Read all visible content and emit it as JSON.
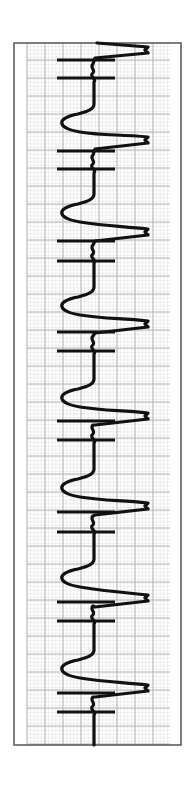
{
  "chart_data": {
    "type": "line",
    "title": "",
    "xlabel": "",
    "ylabel": "",
    "orientation": "vertical (time runs top to bottom)",
    "grid": true,
    "frame": {
      "x": 14,
      "y": 43,
      "width": 167,
      "height": 702,
      "color": "#555555"
    },
    "grid_area": {
      "x": 27,
      "y": 43,
      "width": 143,
      "height": 702
    },
    "grid_major_spacing_px": 18,
    "grid_minor_spacing_px": 3.6,
    "grid_major_color": "#b5b5b5",
    "grid_minor_color": "#e2e2e2",
    "trace_color": "#111111",
    "baseline_x": 93,
    "beats": [
      {
        "peak_y": 50,
        "dip_y": null,
        "bars_y": [
          60,
          78
        ]
      },
      {
        "peak_y": 140,
        "dip_y": 122,
        "bars_y": [
          151,
          169
        ]
      },
      {
        "peak_y": 232,
        "dip_y": 212,
        "bars_y": [
          241,
          261
        ]
      },
      {
        "peak_y": 324,
        "dip_y": 305,
        "bars_y": [
          332,
          351
        ]
      },
      {
        "peak_y": 416,
        "dip_y": 397,
        "bars_y": [
          421,
          440
        ]
      },
      {
        "peak_y": 506,
        "dip_y": 487,
        "bars_y": [
          512,
          532
        ]
      },
      {
        "peak_y": 598,
        "dip_y": 577,
        "bars_y": [
          602,
          621
        ]
      },
      {
        "peak_y": 688,
        "dip_y": 668,
        "bars_y": [
          693,
          712
        ]
      }
    ],
    "peak_x": 148,
    "dip_x": 60,
    "bar_x_range": [
      57,
      115
    ],
    "beat_count": 8,
    "beat_interval_px": 91
  }
}
